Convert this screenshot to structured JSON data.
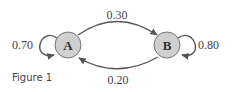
{
  "diagram": {
    "type": "markov-chain",
    "nodes": [
      {
        "id": "A",
        "label": "A",
        "fill": "#cfcfcf"
      },
      {
        "id": "B",
        "label": "B",
        "fill": "#cfcfcf"
      }
    ],
    "edges": [
      {
        "from": "A",
        "to": "A",
        "label": "0.70"
      },
      {
        "from": "A",
        "to": "B",
        "label": "0.30"
      },
      {
        "from": "B",
        "to": "B",
        "label": "0.80"
      },
      {
        "from": "B",
        "to": "A",
        "label": "0.20"
      }
    ],
    "caption": "Figure 1"
  }
}
